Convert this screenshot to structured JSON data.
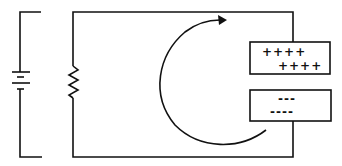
{
  "diagram": {
    "components": {
      "battery": "battery-symbol",
      "resistor": "resistor-symbol",
      "capacitor": "parallel-plate-capacitor",
      "current_arrow": "curved-arrow-clockwise"
    },
    "positive_plate": {
      "row1": "++++",
      "row2": "++++"
    },
    "negative_plate": {
      "row1": "---",
      "row2": "----"
    },
    "colors": {
      "line": "#111111",
      "background": "#ffffff"
    }
  }
}
